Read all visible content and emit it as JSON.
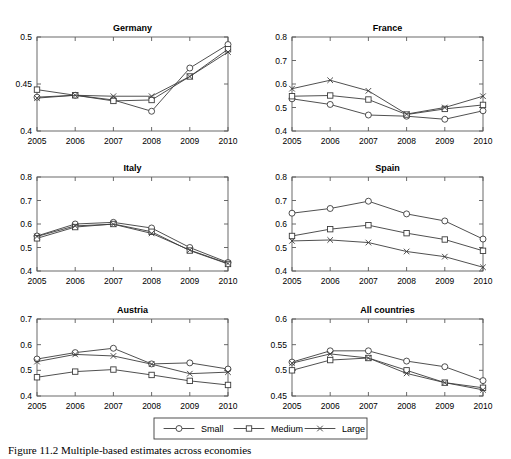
{
  "figure": {
    "caption": "Figure 11.2   Multiple-based estimates across economies"
  },
  "legend": {
    "position": "bottom-center",
    "entries": [
      {
        "label": "Small",
        "marker": "circle-marker"
      },
      {
        "label": "Medium",
        "marker": "square-marker"
      },
      {
        "label": "Large",
        "marker": "cross-marker"
      }
    ]
  },
  "chart_data": [
    {
      "type": "line",
      "title": "Germany",
      "xlabel": "",
      "ylabel": "",
      "x": [
        "2005",
        "2006",
        "2007",
        "2008",
        "2009",
        "2010"
      ],
      "xlim": [
        2005,
        2010
      ],
      "ylim": [
        0.4,
        0.5
      ],
      "yticks": [
        "0.4",
        "0.45",
        "0.5"
      ],
      "ytick_values": [
        0.4,
        0.45,
        0.5
      ],
      "grid": false,
      "series": [
        {
          "name": "Small",
          "values": [
            0.436,
            0.438,
            0.433,
            0.421,
            0.467,
            0.492
          ]
        },
        {
          "name": "Medium",
          "values": [
            0.444,
            0.438,
            0.432,
            0.433,
            0.458,
            0.487
          ]
        },
        {
          "name": "Large",
          "values": [
            0.435,
            0.438,
            0.437,
            0.437,
            0.458,
            0.484
          ]
        }
      ]
    },
    {
      "type": "line",
      "title": "France",
      "xlabel": "",
      "ylabel": "",
      "x": [
        "2005",
        "2006",
        "2007",
        "2008",
        "2009",
        "2010"
      ],
      "xlim": [
        2005,
        2010
      ],
      "ylim": [
        0.4,
        0.8
      ],
      "yticks": [
        "0.4",
        "0.5",
        "0.6",
        "0.7",
        "0.8"
      ],
      "ytick_values": [
        0.4,
        0.5,
        0.6,
        0.7,
        0.8
      ],
      "grid": false,
      "series": [
        {
          "name": "Small",
          "values": [
            0.537,
            0.513,
            0.468,
            0.463,
            0.45,
            0.486
          ]
        },
        {
          "name": "Medium",
          "values": [
            0.548,
            0.551,
            0.534,
            0.47,
            0.494,
            0.511
          ]
        },
        {
          "name": "Large",
          "values": [
            0.58,
            0.616,
            0.571,
            0.472,
            0.5,
            0.548
          ]
        }
      ]
    },
    {
      "type": "line",
      "title": "Italy",
      "xlabel": "",
      "ylabel": "",
      "x": [
        "2005",
        "2006",
        "2007",
        "2008",
        "2009",
        "2010"
      ],
      "xlim": [
        2005,
        2010
      ],
      "ylim": [
        0.4,
        0.8
      ],
      "yticks": [
        "0.4",
        "0.5",
        "0.6",
        "0.7",
        "0.8"
      ],
      "ytick_values": [
        0.4,
        0.5,
        0.6,
        0.7,
        0.8
      ],
      "grid": false,
      "series": [
        {
          "name": "Small",
          "values": [
            0.549,
            0.6,
            0.607,
            0.583,
            0.5,
            0.436
          ]
        },
        {
          "name": "Medium",
          "values": [
            0.539,
            0.587,
            0.6,
            0.567,
            0.487,
            0.43
          ]
        },
        {
          "name": "Large",
          "values": [
            0.547,
            0.592,
            0.599,
            0.56,
            0.489,
            0.432
          ]
        }
      ]
    },
    {
      "type": "line",
      "title": "Spain",
      "xlabel": "",
      "ylabel": "",
      "x": [
        "2005",
        "2006",
        "2007",
        "2008",
        "2009",
        "2010"
      ],
      "xlim": [
        2005,
        2010
      ],
      "ylim": [
        0.4,
        0.8
      ],
      "yticks": [
        "0.4",
        "0.5",
        "0.6",
        "0.7",
        "0.8"
      ],
      "ytick_values": [
        0.4,
        0.5,
        0.6,
        0.7,
        0.8
      ],
      "grid": false,
      "series": [
        {
          "name": "Small",
          "values": [
            0.646,
            0.666,
            0.697,
            0.643,
            0.613,
            0.536
          ]
        },
        {
          "name": "Medium",
          "values": [
            0.549,
            0.578,
            0.595,
            0.561,
            0.534,
            0.486
          ]
        },
        {
          "name": "Large",
          "values": [
            0.528,
            0.532,
            0.521,
            0.483,
            0.461,
            0.416
          ]
        }
      ]
    },
    {
      "type": "line",
      "title": "Austria",
      "xlabel": "",
      "ylabel": "",
      "x": [
        "2005",
        "2006",
        "2007",
        "2008",
        "2009",
        "2010"
      ],
      "xlim": [
        2005,
        2010
      ],
      "ylim": [
        0.4,
        0.7
      ],
      "yticks": [
        "0.4",
        "0.5",
        "0.6",
        "0.7"
      ],
      "ytick_values": [
        0.4,
        0.5,
        0.6,
        0.7
      ],
      "grid": false,
      "series": [
        {
          "name": "Small",
          "values": [
            0.544,
            0.569,
            0.586,
            0.525,
            0.529,
            0.505
          ]
        },
        {
          "name": "Medium",
          "values": [
            0.473,
            0.495,
            0.503,
            0.482,
            0.459,
            0.443
          ]
        },
        {
          "name": "Large",
          "values": [
            0.534,
            0.562,
            0.556,
            0.524,
            0.487,
            0.493
          ]
        }
      ]
    },
    {
      "type": "line",
      "title": "All countries",
      "xlabel": "",
      "ylabel": "",
      "x": [
        "2005",
        "2006",
        "2007",
        "2008",
        "2009",
        "2010"
      ],
      "xlim": [
        2005,
        2010
      ],
      "ylim": [
        0.45,
        0.6
      ],
      "yticks": [
        "0.45",
        "0.5",
        "0.55",
        "0.6"
      ],
      "ytick_values": [
        0.45,
        0.5,
        0.55,
        0.6
      ],
      "grid": false,
      "series": [
        {
          "name": "Small",
          "values": [
            0.516,
            0.538,
            0.538,
            0.518,
            0.507,
            0.48
          ]
        },
        {
          "name": "Medium",
          "values": [
            0.5,
            0.52,
            0.524,
            0.5,
            0.476,
            0.466
          ]
        },
        {
          "name": "Large",
          "values": [
            0.514,
            0.532,
            0.524,
            0.494,
            0.476,
            0.462
          ]
        }
      ]
    }
  ]
}
